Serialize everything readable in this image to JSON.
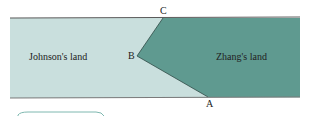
{
  "diagram": {
    "regions": [
      {
        "name": "Johnson's land",
        "color": "#c9dfdd"
      },
      {
        "name": "Zhang's land",
        "color": "#5f9a90"
      }
    ],
    "points": {
      "A": {
        "label": "A"
      },
      "B": {
        "label": "B"
      },
      "C": {
        "label": "C"
      }
    },
    "border_color": "#5a5a5a"
  }
}
